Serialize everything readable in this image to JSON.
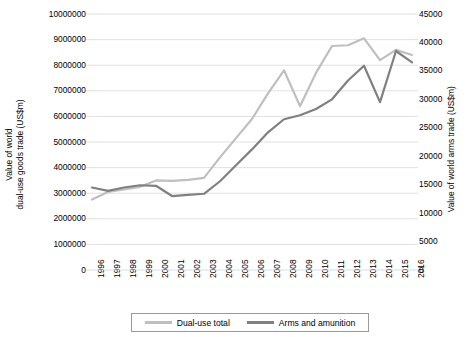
{
  "chart_data": {
    "type": "line",
    "title": "",
    "xlabel": "",
    "grid": "horizontal",
    "legend_position": "bottom",
    "x": [
      1996,
      1997,
      1998,
      1999,
      2000,
      2001,
      2002,
      2003,
      2004,
      2005,
      2006,
      2007,
      2008,
      2009,
      2010,
      2011,
      2012,
      2013,
      2014,
      2015,
      2016
    ],
    "categories": [
      "1996",
      "1997",
      "1998",
      "1999",
      "2000",
      "2001",
      "2002",
      "2003",
      "2004",
      "2005",
      "2006",
      "2007",
      "2008",
      "2009",
      "2010",
      "2011",
      "2012",
      "2013",
      "2014",
      "2015",
      "2016"
    ],
    "axes": {
      "left": {
        "label": "Value of world\ndual-use goods trade (US$m)",
        "label_line1": "Value of world",
        "label_line2": "dual-use goods trade (US$m)",
        "ticks": [
          0,
          1000000,
          2000000,
          3000000,
          4000000,
          5000000,
          6000000,
          7000000,
          8000000,
          9000000,
          10000000
        ],
        "tick_labels": [
          "0",
          "1000000",
          "2000000",
          "3000000",
          "4000000",
          "5000000",
          "6000000",
          "7000000",
          "8000000",
          "9000000",
          "10000000"
        ],
        "ylim": [
          0,
          10000000
        ]
      },
      "right": {
        "label": "Value of world arms trade (US$m)",
        "ticks": [
          0,
          5000,
          10000,
          15000,
          20000,
          25000,
          30000,
          35000,
          40000,
          45000
        ],
        "tick_labels": [
          "0",
          "5000",
          "10000",
          "15000",
          "20000",
          "25000",
          "30000",
          "35000",
          "40000",
          "45000"
        ],
        "ylim": [
          0,
          45000
        ]
      }
    },
    "series": [
      {
        "name": "Dual-use total",
        "axis": "left",
        "color": "#BFBFBF",
        "values": [
          2750000,
          3050000,
          3150000,
          3250000,
          3500000,
          3480000,
          3520000,
          3600000,
          4400000,
          5150000,
          5900000,
          6900000,
          7800000,
          6400000,
          7700000,
          8750000,
          8780000,
          9050000,
          8200000,
          8600000,
          8400000
        ]
      },
      {
        "name": "Arms and amunition",
        "axis": "right",
        "color": "#808080",
        "values": [
          14500,
          13900,
          14500,
          14900,
          14800,
          13000,
          13200,
          13400,
          15600,
          18400,
          21200,
          24200,
          26500,
          27200,
          28300,
          30000,
          33300,
          35900,
          29500,
          38500,
          36500
        ]
      }
    ]
  },
  "legend": {
    "items": [
      {
        "label": "Dual-use total",
        "color": "#BFBFBF"
      },
      {
        "label": "Arms and amunition",
        "color": "#808080"
      }
    ]
  }
}
